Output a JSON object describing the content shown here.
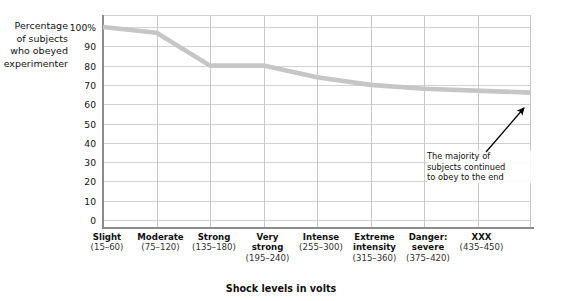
{
  "chart_data": {
    "type": "line",
    "title": "",
    "xlabel": "Shock levels in volts",
    "ylabel": "Percentage of subjects who obeyed experimenter",
    "ylabel_lines": [
      "Percentage",
      "of subjects",
      "who obeyed",
      "experimenter"
    ],
    "categories": [
      "Slight",
      "Moderate",
      "Strong",
      "Very strong",
      "Intense",
      "Extreme intensity",
      "Danger: severe",
      "XXX"
    ],
    "category_lines": [
      [
        "Slight"
      ],
      [
        "Moderate"
      ],
      [
        "Strong"
      ],
      [
        "Very",
        "strong"
      ],
      [
        "Intense"
      ],
      [
        "Extreme",
        "intensity"
      ],
      [
        "Danger:",
        "severe"
      ],
      [
        "XXX"
      ]
    ],
    "category_ranges": [
      "(15–60)",
      "(75–120)",
      "(135–180)",
      "(195–240)",
      "(255–300)",
      "(315–360)",
      "(375–420)",
      "(435–450)"
    ],
    "values": [
      100,
      97,
      80,
      80,
      74,
      70,
      68,
      66
    ],
    "ylim": [
      0,
      100
    ],
    "ytick_values": [
      0,
      10,
      20,
      30,
      40,
      50,
      60,
      70,
      80,
      90,
      100
    ],
    "ytick_labels": [
      "0",
      "10",
      "20",
      "30",
      "40",
      "50",
      "60",
      "70",
      "80",
      "90",
      "100%"
    ],
    "grid": "both",
    "legend": "none",
    "line_color": "#c6c6c6",
    "grid_color": "#d2d2d2",
    "axis_color": "#8c8c8c",
    "annotations": [
      {
        "text": "The majority of subjects continued to obey to the end",
        "lines": [
          "The majority of",
          "subjects continued",
          "to obey to the end"
        ],
        "points_to_category": "XXX",
        "points_to_value": 66
      }
    ]
  }
}
